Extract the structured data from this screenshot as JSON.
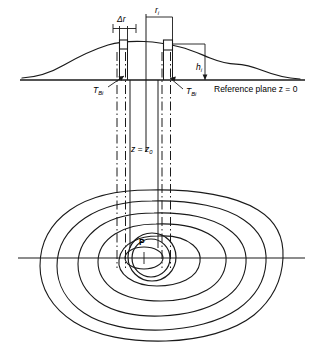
{
  "figure": {
    "type": "technical-diagram",
    "labels": {
      "delta_r": "Δr",
      "r_i_base": "r",
      "r_i_sub": "i",
      "h_i_base": "h",
      "h_i_sub": "i",
      "t_bi_left_base": "T",
      "t_bi_left_sub": "Bi",
      "t_bi_right_base": "T",
      "t_bi_right_sub": "Bi",
      "reference_plane": "Reference plane z = 0",
      "z_equals_base": "z = z",
      "z_equals_sub": "0",
      "point_p": "P"
    },
    "colors": {
      "line": "#1a1a1a",
      "background": "#ffffff",
      "text": "#000000"
    },
    "geometry": {
      "reference_line_y": 80,
      "map_axis_y": 258,
      "terrain_peak_y": 42,
      "contour_count": 5,
      "prism_count": 2,
      "vertical_extent_top": 36,
      "vertical_extent_bottom": 268
    }
  }
}
